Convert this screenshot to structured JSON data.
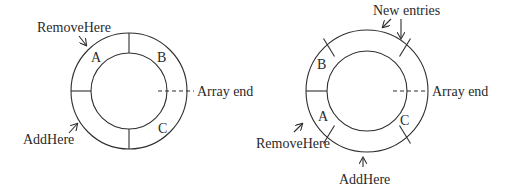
{
  "diagrams": [
    {
      "name": "left-buffer",
      "slots": {
        "a": "A",
        "b": "B",
        "c": "C"
      },
      "labels": {
        "remove_here": "RemoveHere",
        "add_here": "AddHere",
        "array_end": "Array end"
      }
    },
    {
      "name": "right-buffer",
      "slots": {
        "a": "A",
        "b": "B",
        "c": "C"
      },
      "labels": {
        "new_entries": "New entries",
        "remove_here": "RemoveHere",
        "add_here": "AddHere",
        "array_end": "Array end"
      }
    }
  ],
  "colors": {
    "stroke": "#2f2f2f",
    "text": "#2a2a2a",
    "background": "#ffffff"
  }
}
